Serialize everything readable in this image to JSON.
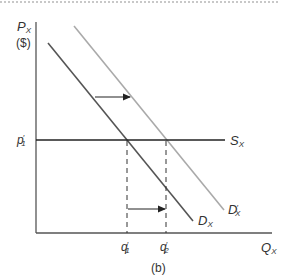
{
  "figure": {
    "panel_label": "(b)",
    "colors": {
      "axis": "#555555",
      "demand_original": "#555555",
      "demand_shifted": "#aaaaaa",
      "supply": "#222222",
      "guide": "#333333",
      "arrow": "#222222",
      "border": "#c8c8c8"
    }
  },
  "axes": {
    "y_label_main": "P",
    "y_label_sub": "X",
    "y_unit": "($)",
    "x_label_main": "Q",
    "x_label_sub": "X"
  },
  "curves": {
    "supply": {
      "main": "S",
      "sub": "X"
    },
    "demand": {
      "main": "D",
      "sub": "X"
    },
    "demand_shifted": {
      "main": "D",
      "sub": "X",
      "prime": "′"
    }
  },
  "ticks": {
    "price": {
      "main": "p",
      "sub": "1",
      "prime": "′"
    },
    "q1": {
      "main": "q",
      "sub": "1",
      "prime": "′"
    },
    "q2": {
      "main": "q",
      "sub": "2",
      "prime": "′"
    }
  }
}
